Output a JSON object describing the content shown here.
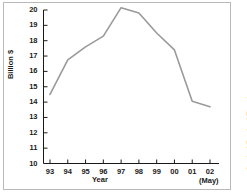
{
  "figure": {
    "ylabel": "Billion $",
    "xlabel": "Year",
    "may_note": "(May)",
    "source": "Source: Central Bank of Egypt",
    "line_color": "#9a9a9a",
    "axis_color": "#1a1a1a",
    "frame_color": "#b9b9b9",
    "background": "#ffffff"
  },
  "chart_data": {
    "type": "line",
    "title": "",
    "xlabel": "Year",
    "ylabel": "Billion $",
    "categories": [
      "93",
      "94",
      "95",
      "96",
      "97",
      "98",
      "99",
      "00",
      "01",
      "02"
    ],
    "x": [
      93,
      94,
      95,
      96,
      97,
      98,
      99,
      100,
      101,
      102
    ],
    "values": [
      14.5,
      16.75,
      17.6,
      18.3,
      20.15,
      19.8,
      18.5,
      17.4,
      14.05,
      13.7
    ],
    "series": [
      {
        "name": "Billion $",
        "values": [
          14.5,
          16.75,
          17.6,
          18.3,
          20.15,
          19.8,
          18.5,
          17.4,
          14.05,
          13.7
        ]
      }
    ],
    "ylim": [
      10,
      20
    ],
    "xlim": [
      93,
      102
    ],
    "yticks": [
      10,
      11,
      12,
      13,
      14,
      15,
      16,
      17,
      18,
      19,
      20
    ],
    "ytick_labels": [
      "10",
      "11",
      "12",
      "13",
      "14",
      "15",
      "16",
      "17",
      "18",
      "19",
      "20"
    ],
    "xtick_labels": [
      "93",
      "94",
      "95",
      "96",
      "97",
      "98",
      "99",
      "00",
      "01",
      "02"
    ],
    "grid": false,
    "legend": null,
    "annotations": [
      "(May)",
      "Source: Central Bank of Egypt"
    ]
  }
}
